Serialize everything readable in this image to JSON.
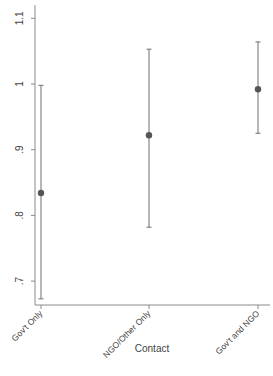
{
  "chart_data": {
    "type": "scatter",
    "subtype": "point_estimates_with_confidence_intervals",
    "title": "",
    "xlabel": "Contact",
    "ylabel": "",
    "categories": [
      "Gov't Only",
      "NGO/Other Only",
      "Gov't and NGO"
    ],
    "series": [
      {
        "name": "estimate",
        "values": [
          0.834,
          0.922,
          0.992
        ],
        "ci_upper": [
          0.998,
          1.053,
          1.064
        ],
        "ci_lower": [
          0.673,
          0.782,
          0.925
        ]
      }
    ],
    "yticks": [
      {
        "value": 0.7,
        "label": ".7"
      },
      {
        "value": 0.8,
        "label": ".8"
      },
      {
        "value": 0.9,
        "label": ".9"
      },
      {
        "value": 1.0,
        "label": "1"
      },
      {
        "value": 1.1,
        "label": "1.1"
      }
    ],
    "ylim": [
      0.66,
      1.12
    ],
    "grid": false,
    "legend": null,
    "colors": {
      "point": "#555555",
      "errorbar": "#6e6e6e",
      "axis": "#8a8a8a",
      "text": "#444444"
    }
  }
}
